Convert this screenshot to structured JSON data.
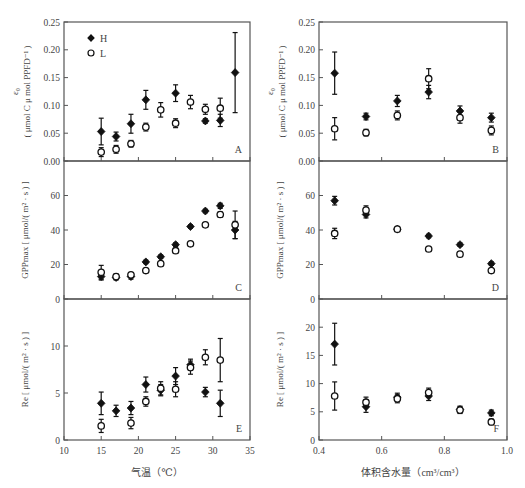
{
  "figure": {
    "legend": [
      {
        "label": "H",
        "marker": "filled-diamond"
      },
      {
        "label": "L",
        "marker": "open-circle"
      }
    ],
    "left_xlabel": "气温（℃）",
    "right_xlabel": "体积含水量（cm³/cm³）",
    "colors": {
      "axis": "#555555",
      "marker": "#111111",
      "text": "#444444"
    }
  },
  "chart_data": [
    {
      "panel": "A",
      "type": "scatter",
      "xlabel": "气温（℃）",
      "ylabel": "ε0 (μmol C μmol PPFD⁻¹)",
      "xlim": [
        10,
        35
      ],
      "ylim": [
        0,
        0.25
      ],
      "xticks": [
        10,
        15,
        20,
        25,
        30,
        35
      ],
      "yticks": [
        0.0,
        0.05,
        0.1,
        0.15,
        0.2,
        0.25
      ],
      "ytick_labels": [
        "0.00",
        "0.05",
        "0.10",
        "0.15",
        "0.20",
        "0.25"
      ],
      "legend_position": "upper left",
      "series": [
        {
          "name": "H",
          "x": [
            15,
            17,
            19,
            21,
            25,
            29,
            31,
            33
          ],
          "y": [
            0.053,
            0.044,
            0.067,
            0.11,
            0.122,
            0.072,
            0.073,
            0.159
          ],
          "err": [
            0.024,
            0.008,
            0.017,
            0.017,
            0.015,
            0.004,
            0.011,
            0.072
          ]
        },
        {
          "name": "L",
          "x": [
            15,
            17,
            19,
            21,
            23,
            25,
            27,
            29,
            31
          ],
          "y": [
            0.016,
            0.021,
            0.031,
            0.061,
            0.092,
            0.068,
            0.106,
            0.093,
            0.095
          ],
          "err": [
            0.008,
            0.007,
            0.006,
            0.007,
            0.013,
            0.008,
            0.012,
            0.009,
            0.018
          ]
        }
      ]
    },
    {
      "panel": "B",
      "type": "scatter",
      "xlabel": "体积含水量（cm³/cm³）",
      "ylabel": "ε0 (μmol C μmol PPFD⁻¹)",
      "xlim": [
        0.4,
        1.0
      ],
      "ylim": [
        0,
        0.25
      ],
      "xticks": [
        0.4,
        0.6,
        0.8,
        1.0
      ],
      "yticks": [
        0.0,
        0.05,
        0.1,
        0.15,
        0.2,
        0.25
      ],
      "ytick_labels": [
        "0.00",
        "0.05",
        "0.10",
        "0.15",
        "0.20",
        "0.25"
      ],
      "series": [
        {
          "name": "H",
          "x": [
            0.45,
            0.55,
            0.65,
            0.75,
            0.85,
            0.95
          ],
          "y": [
            0.158,
            0.08,
            0.108,
            0.124,
            0.09,
            0.078
          ],
          "err": [
            0.038,
            0.006,
            0.01,
            0.012,
            0.009,
            0.008
          ]
        },
        {
          "name": "L",
          "x": [
            0.45,
            0.55,
            0.65,
            0.75,
            0.85,
            0.95
          ],
          "y": [
            0.058,
            0.051,
            0.082,
            0.148,
            0.078,
            0.055
          ],
          "err": [
            0.02,
            0.006,
            0.008,
            0.018,
            0.01,
            0.008
          ]
        }
      ]
    },
    {
      "panel": "C",
      "type": "scatter",
      "xlabel": "气温（℃）",
      "ylabel": "GPPmax [μmol/(m²·s)]",
      "xlim": [
        10,
        35
      ],
      "ylim": [
        0,
        80
      ],
      "xticks": [
        10,
        15,
        20,
        25,
        30,
        35
      ],
      "yticks": [
        0,
        20,
        40,
        60
      ],
      "ytick_labels": [
        "0",
        "20",
        "40",
        "60"
      ],
      "series": [
        {
          "name": "H",
          "x": [
            15,
            17,
            19,
            21,
            23,
            25,
            27,
            29,
            31,
            33
          ],
          "y": [
            13,
            12.5,
            13,
            21.5,
            24.5,
            31.5,
            42,
            51,
            54,
            40
          ],
          "err": [
            2,
            1.5,
            1.5,
            1,
            1,
            1,
            1,
            1,
            1.5,
            5
          ]
        },
        {
          "name": "L",
          "x": [
            15,
            17,
            19,
            21,
            23,
            25,
            27,
            29,
            31,
            33
          ],
          "y": [
            15.5,
            13,
            14,
            16.5,
            20.5,
            28,
            32,
            43,
            49,
            43
          ],
          "err": [
            4,
            1.5,
            1,
            1,
            1,
            1.5,
            1,
            1,
            1.5,
            8
          ]
        }
      ]
    },
    {
      "panel": "D",
      "type": "scatter",
      "xlabel": "体积含水量（cm³/cm³）",
      "ylabel": "GPPmax [μmol/(m²·s)]",
      "xlim": [
        0.4,
        1.0
      ],
      "ylim": [
        0,
        80
      ],
      "xticks": [
        0.4,
        0.6,
        0.8,
        1.0
      ],
      "yticks": [
        0,
        20,
        40,
        60
      ],
      "ytick_labels": [
        "0",
        "20",
        "40",
        "60"
      ],
      "series": [
        {
          "name": "H",
          "x": [
            0.45,
            0.55,
            0.65,
            0.75,
            0.85,
            0.95
          ],
          "y": [
            57,
            49,
            40.5,
            36.5,
            31.5,
            20.5
          ],
          "err": [
            2.5,
            2,
            1,
            1,
            1,
            1
          ]
        },
        {
          "name": "L",
          "x": [
            0.45,
            0.55,
            0.65,
            0.75,
            0.85,
            0.95
          ],
          "y": [
            38,
            51.5,
            40.5,
            29,
            26,
            16.5
          ],
          "err": [
            3,
            2.5,
            1,
            1,
            1,
            1
          ]
        }
      ]
    },
    {
      "panel": "E",
      "type": "scatter",
      "xlabel": "气温（℃）",
      "ylabel": "Re [μmol/(m²·s)]",
      "xlim": [
        10,
        35
      ],
      "ylim": [
        0,
        15
      ],
      "xticks": [
        10,
        15,
        20,
        25,
        30,
        35
      ],
      "yticks": [
        0,
        5,
        10
      ],
      "ytick_labels": [
        "0",
        "5",
        "10"
      ],
      "series": [
        {
          "name": "H",
          "x": [
            15,
            17,
            19,
            21,
            23,
            25,
            27,
            29,
            31
          ],
          "y": [
            3.9,
            3.1,
            3.4,
            5.9,
            5.3,
            6.8,
            8.0,
            5.1,
            3.9
          ],
          "err": [
            1.2,
            0.6,
            0.7,
            0.8,
            0.6,
            0.9,
            0.6,
            0.5,
            1.4
          ]
        },
        {
          "name": "L",
          "x": [
            15,
            17,
            19,
            21,
            23,
            25,
            27,
            29,
            31
          ],
          "y": [
            1.5,
            null,
            1.8,
            4.1,
            5.5,
            5.4,
            7.7,
            8.8,
            8.5
          ],
          "err": [
            0.7,
            null,
            0.6,
            0.5,
            0.7,
            0.8,
            0.7,
            0.8,
            2.3
          ]
        }
      ]
    },
    {
      "panel": "F",
      "type": "scatter",
      "xlabel": "体积含水量（cm³/cm³）",
      "ylabel": "Re [μmol/(m²·s)]",
      "xlim": [
        0.4,
        1.0
      ],
      "ylim": [
        0,
        25
      ],
      "xticks": [
        0.4,
        0.6,
        0.8,
        1.0
      ],
      "yticks": [
        0,
        5,
        10,
        15,
        20
      ],
      "ytick_labels": [
        "0",
        "5",
        "10",
        "15",
        "20"
      ],
      "series": [
        {
          "name": "H",
          "x": [
            0.45,
            0.55,
            0.65,
            0.75,
            0.85,
            0.95
          ],
          "y": [
            17,
            5.9,
            7.6,
            7.8,
            5.4,
            4.8
          ],
          "err": [
            3.7,
            1.0,
            0.7,
            0.8,
            0.6,
            0.5
          ]
        },
        {
          "name": "L",
          "x": [
            0.45,
            0.55,
            0.65,
            0.75,
            0.85,
            0.95
          ],
          "y": [
            7.8,
            6.7,
            7.3,
            8.4,
            5.3,
            3.2
          ],
          "err": [
            2.5,
            0.9,
            0.7,
            0.8,
            0.6,
            0.5
          ]
        }
      ]
    }
  ]
}
